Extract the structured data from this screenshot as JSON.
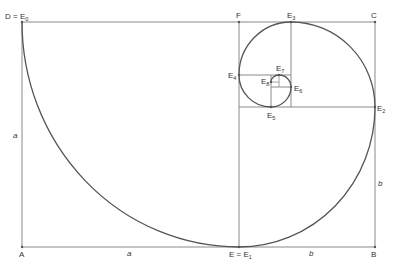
{
  "diagram": {
    "colors": {
      "line": "#8a8a8a",
      "spiral": "#555555",
      "text": "#333333",
      "background": "#ffffff"
    },
    "points": {
      "D": {
        "label": "D = E",
        "sub": "0"
      },
      "F": {
        "label": "F"
      },
      "E3": {
        "label": "E",
        "sub": "3"
      },
      "C": {
        "label": "C"
      },
      "E4": {
        "label": "E",
        "sub": "4"
      },
      "E7": {
        "label": "E",
        "sub": "7"
      },
      "E8": {
        "label": "E",
        "sub": "8"
      },
      "E6": {
        "label": "E",
        "sub": "6"
      },
      "E5": {
        "label": "E",
        "sub": "5"
      },
      "E2": {
        "label": "E",
        "sub": "2"
      },
      "A": {
        "label": "A"
      },
      "E1": {
        "label": "E = E",
        "sub": "1"
      },
      "B": {
        "label": "B"
      }
    },
    "lengths": {
      "left_side": "a",
      "bottom_left": "a",
      "bottom_right": "b",
      "right_side": "b"
    }
  }
}
